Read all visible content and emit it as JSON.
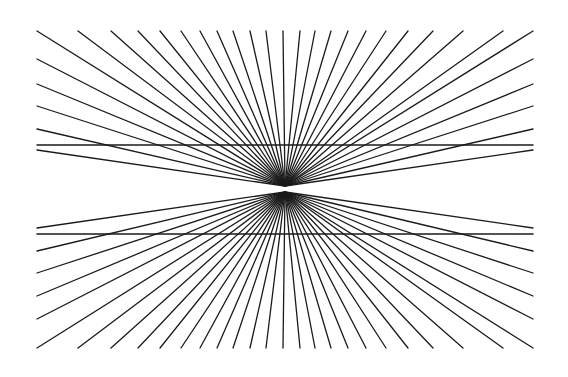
{
  "figure": {
    "name": "hering-illusion",
    "background": "#ffffff",
    "stroke_color": "#1a1a1a",
    "bounds": {
      "left": 37,
      "right": 533,
      "top": 31,
      "bottom": 348
    },
    "upper_fan": {
      "center": [
        285,
        186
      ],
      "edge_y": 31,
      "top_x": [
        37,
        78,
        111,
        138,
        160,
        181,
        200,
        217,
        233,
        250,
        266,
        283,
        300,
        315,
        331,
        348,
        366,
        386,
        408,
        433,
        463,
        503
      ],
      "left_y": [
        59,
        84,
        106,
        129,
        150
      ],
      "right_y": [
        59,
        84,
        106,
        129,
        150
      ]
    },
    "lower_fan": {
      "center": [
        285,
        192
      ],
      "edge_y": 348,
      "bottom_x": [
        37,
        78,
        111,
        138,
        160,
        181,
        200,
        217,
        233,
        250,
        266,
        283,
        300,
        315,
        331,
        348,
        366,
        386,
        408,
        433,
        463,
        503
      ],
      "left_y": [
        228,
        251,
        273,
        296,
        319
      ],
      "right_y": [
        228,
        251,
        273,
        296,
        319
      ]
    },
    "parallel_lines": [
      {
        "y": 145,
        "x1": 37,
        "x2": 533
      },
      {
        "y": 234,
        "x1": 37,
        "x2": 533
      }
    ]
  }
}
